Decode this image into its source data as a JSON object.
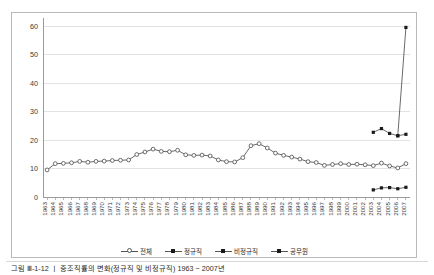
{
  "figure": {
    "caption": "그림 Ⅲ-1-12 ㅣ 중조직률의 변화(정규직 및 비정규직) 1963 ~ 2007년"
  },
  "legend": {
    "position": "bottom-center",
    "items": [
      {
        "label": "전체",
        "marker": "open-circle",
        "icon": "legend-marker-open-circle"
      },
      {
        "label": "정규직",
        "marker": "filled-square",
        "icon": "legend-marker-filled-square"
      },
      {
        "label": "비정규직",
        "marker": "filled-square",
        "icon": "legend-marker-filled-square"
      },
      {
        "label": "공무원",
        "marker": "filled-square",
        "icon": "legend-marker-filled-square"
      }
    ]
  },
  "axes": {
    "y_ticks": [
      "0",
      "10",
      "20",
      "30",
      "40",
      "50",
      "60"
    ],
    "x_ticks": [
      "1963",
      "1964",
      "1965",
      "1966",
      "1967",
      "1968",
      "1969",
      "1970",
      "1971",
      "1972",
      "1973",
      "1974",
      "1975",
      "1976",
      "1977",
      "1978",
      "1979",
      "1980",
      "1981",
      "1982",
      "1983",
      "1984",
      "1985",
      "1986",
      "1987",
      "1988",
      "1989",
      "1990",
      "1991",
      "1992",
      "1993",
      "1994",
      "1995",
      "1996",
      "1997",
      "1998",
      "1999",
      "2000",
      "2001",
      "2002",
      "2003",
      "2004",
      "2005",
      "2006",
      "2007"
    ]
  },
  "colors": {
    "line": "#595959",
    "marker_fill": "#ffffff",
    "marker_edge": "#4a4a4a",
    "filled_marker": "#1a1a1a",
    "grid": "#e2e2e2",
    "axis": "#9a9a9a",
    "frame": "#b9b9b9",
    "text": "#3a3a3a"
  },
  "chart_data": {
    "type": "line",
    "title": "",
    "xlabel": "",
    "ylabel": "",
    "ylim": [
      0,
      60
    ],
    "grid": true,
    "legend_position": "bottom",
    "x": [
      "1963",
      "1964",
      "1965",
      "1966",
      "1967",
      "1968",
      "1969",
      "1970",
      "1971",
      "1972",
      "1973",
      "1974",
      "1975",
      "1976",
      "1977",
      "1978",
      "1979",
      "1980",
      "1981",
      "1982",
      "1983",
      "1984",
      "1985",
      "1986",
      "1987",
      "1988",
      "1989",
      "1990",
      "1991",
      "1992",
      "1993",
      "1994",
      "1995",
      "1996",
      "1997",
      "1998",
      "1999",
      "2000",
      "2001",
      "2002",
      "2003",
      "2004",
      "2005",
      "2006",
      "2007"
    ],
    "series": [
      {
        "name": "전체",
        "marker": "open-circle",
        "x": [
          "1963",
          "1964",
          "1965",
          "1966",
          "1967",
          "1968",
          "1969",
          "1970",
          "1971",
          "1972",
          "1973",
          "1974",
          "1975",
          "1976",
          "1977",
          "1978",
          "1979",
          "1980",
          "1981",
          "1982",
          "1983",
          "1984",
          "1985",
          "1986",
          "1987",
          "1988",
          "1989",
          "1990",
          "1991",
          "1992",
          "1993",
          "1994",
          "1995",
          "1996",
          "1997",
          "1998",
          "1999",
          "2000",
          "2001",
          "2002",
          "2003",
          "2004",
          "2005",
          "2006",
          "2007"
        ],
        "values": [
          9.5,
          11.7,
          11.8,
          12.0,
          12.5,
          12.2,
          12.5,
          12.6,
          12.8,
          12.9,
          13.0,
          14.9,
          15.8,
          16.8,
          16.0,
          15.9,
          16.4,
          14.8,
          14.6,
          14.7,
          14.4,
          13.0,
          12.4,
          12.3,
          13.8,
          18.0,
          18.7,
          17.2,
          15.4,
          14.6,
          14.0,
          13.3,
          12.4,
          12.1,
          11.1,
          11.4,
          11.7,
          11.4,
          11.5,
          11.3,
          11.0,
          11.9,
          10.9,
          10.2,
          11.7
        ]
      },
      {
        "name": "정규직",
        "marker": "filled-square",
        "x": [
          "2003",
          "2004",
          "2005",
          "2006",
          "2007"
        ],
        "values": [
          22.7,
          24.0,
          22.3,
          21.5,
          22.0
        ]
      },
      {
        "name": "비정규직",
        "marker": "filled-square",
        "x": [
          "2003",
          "2004",
          "2005",
          "2006",
          "2007"
        ],
        "values": [
          2.5,
          3.2,
          3.3,
          2.9,
          3.4
        ]
      },
      {
        "name": "공무원",
        "marker": "filled-square",
        "x": [
          "2006",
          "2007"
        ],
        "values": [
          21.5,
          59.5
        ]
      }
    ]
  }
}
